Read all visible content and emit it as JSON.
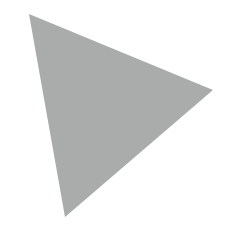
{
  "canvas": {
    "width": 234,
    "height": 244,
    "background_color": "#ffffff",
    "name": "triangle-canvas"
  },
  "shape": {
    "kind": "triangle",
    "icon_name": "triangle-icon",
    "fill_color": "#aaabab",
    "stroke_color": "none",
    "stroke_width": 0,
    "opacity": 1,
    "vertices": [
      {
        "label": "top-left-apex",
        "x": 29,
        "y": 14
      },
      {
        "label": "right-vertex",
        "x": 213,
        "y": 90
      },
      {
        "label": "bottom-vertex",
        "x": 65,
        "y": 217
      }
    ],
    "points_attr": "29,14 213,90 65,217"
  }
}
